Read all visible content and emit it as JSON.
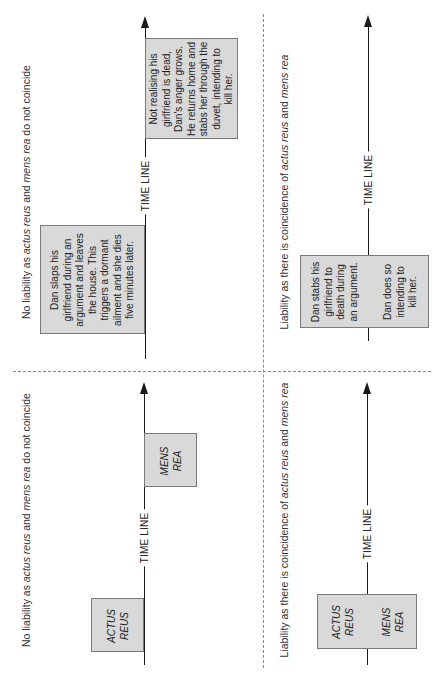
{
  "panels": {
    "top_left": {
      "caption": {
        "pre": "No liability as ",
        "i1": "actus reus",
        "mid": " and ",
        "i2": "mens rea",
        "post": " do not coincide"
      },
      "timeline_label": "TIME LINE",
      "box_early": [
        "Dan slaps his",
        "girlfriend during an",
        "argument and leaves",
        "the house. This",
        "triggers a dormant",
        "ailment and she dies",
        "five minutes later."
      ],
      "box_late": [
        "Not realising his",
        "girlfriend is dead,",
        "Dan's anger grows.",
        "He returns home and",
        "stabs her through the",
        "duvet, intending to",
        "kill her."
      ]
    },
    "top_right": {
      "caption": {
        "pre": "Liability as there is coincidence of ",
        "i1": "actus reus",
        "mid": " and ",
        "i2": "mens rea",
        "post": ""
      },
      "timeline_label": "TIME LINE",
      "box_left": [
        "Dan stabs his",
        "girlfriend to",
        "death during",
        "an argument."
      ],
      "box_right": [
        "Dan does so",
        "intending to",
        "kill her."
      ]
    },
    "bottom_left": {
      "caption": {
        "pre": "No liability as ",
        "i1": "actus reus",
        "mid": " and ",
        "i2": "mens rea",
        "post": " do not coincide"
      },
      "timeline_label": "TIME LINE",
      "box_early": [
        "ACTUS",
        "REUS"
      ],
      "box_late": [
        "MENS",
        "REA"
      ]
    },
    "bottom_right": {
      "caption": {
        "pre": "Liability as there is coincidence of ",
        "i1": "actus reus",
        "mid": " and ",
        "i2": "mens rea",
        "post": ""
      },
      "timeline_label": "TIME LINE",
      "box_left": [
        "ACTUS",
        "REUS"
      ],
      "box_right": [
        "MENS",
        "REA"
      ]
    }
  }
}
